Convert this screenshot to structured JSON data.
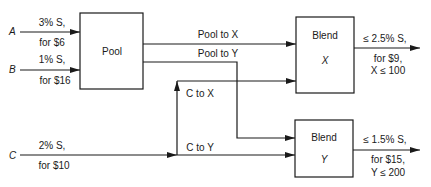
{
  "inputs": [
    {
      "id": "A",
      "sulfur": "3% S,",
      "cost": "for $6"
    },
    {
      "id": "B",
      "sulfur": "1% S,",
      "cost": "for $16"
    },
    {
      "id": "C",
      "sulfur": "2% S,",
      "cost": "for $10"
    }
  ],
  "pool": {
    "label": "Pool"
  },
  "flows": {
    "pool_to_x": "Pool to X",
    "pool_to_y": "Pool to Y",
    "c_to_x": "C to X",
    "c_to_y": "C to Y"
  },
  "blends": [
    {
      "label": "Blend",
      "product": "X",
      "spec": "≤ 2.5% S,",
      "price": "for $9,",
      "limit": "X ≤ 100"
    },
    {
      "label": "Blend",
      "product": "Y",
      "spec": "≤ 1.5% S,",
      "price": "for $15,",
      "limit": "Y ≤ 200"
    }
  ],
  "colors": {
    "line": "#1a1a1a",
    "background": "#ffffff"
  }
}
